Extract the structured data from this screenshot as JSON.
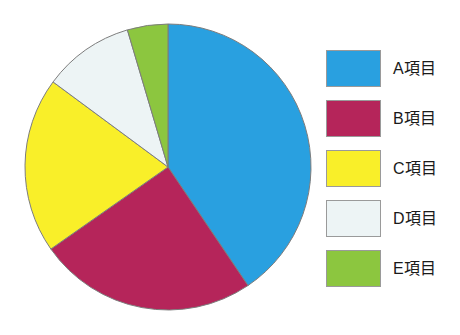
{
  "chart_data": {
    "type": "pie",
    "title": "",
    "subtitle": "",
    "xlabel": "",
    "ylabel": "",
    "grid": false,
    "legend_position": "right",
    "start_angle_deg": 0,
    "direction": "clockwise",
    "categories": [
      "A項目",
      "B項目",
      "C項目",
      "D項目",
      "E項目"
    ],
    "values": [
      40.5,
      24.8,
      19.9,
      10.2,
      4.6
    ],
    "value_unit": "percent",
    "slice_angles_deg": [
      146.0,
      89.0,
      71.5,
      37.0,
      16.5
    ],
    "slice_boundaries_deg": [
      0,
      146.0,
      235.0,
      306.5,
      343.5,
      360
    ],
    "colors": [
      "#29a0e0",
      "#b5255a",
      "#f9ef29",
      "#edf4f5",
      "#8cc63f"
    ],
    "slice_border_color": "#7d7d7d",
    "slice_border_width": 1,
    "background": "#ffffff",
    "slices": [
      {
        "label": "A項目",
        "value": 40.5,
        "color": "#29a0e0",
        "start_deg": 0,
        "end_deg": 146.0
      },
      {
        "label": "B項目",
        "value": 24.8,
        "color": "#b5255a",
        "start_deg": 146.0,
        "end_deg": 235.0
      },
      {
        "label": "C項目",
        "value": 19.9,
        "color": "#f9ef29",
        "start_deg": 235.0,
        "end_deg": 306.5
      },
      {
        "label": "D項目",
        "value": 10.2,
        "color": "#edf4f5",
        "start_deg": 306.5,
        "end_deg": 343.5
      },
      {
        "label": "E項目",
        "value": 4.6,
        "color": "#8cc63f",
        "start_deg": 343.5,
        "end_deg": 360.0
      }
    ]
  },
  "legend": {
    "items": [
      {
        "label": "A項目",
        "color": "#29a0e0"
      },
      {
        "label": "B項目",
        "color": "#b5255a"
      },
      {
        "label": "C項目",
        "color": "#f9ef29"
      },
      {
        "label": "D項目",
        "color": "#edf4f5"
      },
      {
        "label": "E項目",
        "color": "#8cc63f"
      }
    ]
  }
}
